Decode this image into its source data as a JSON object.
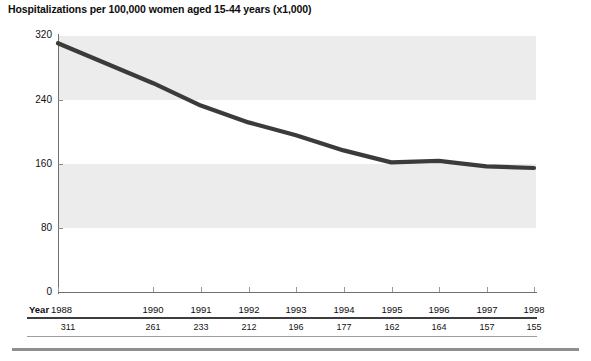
{
  "chart_data": {
    "type": "line",
    "title": "Hospitalizations per 100,000 women aged 15-44 years (x1,000)",
    "xlabel": "Year",
    "ylabel": "",
    "categories": [
      "1988",
      "1990",
      "1991",
      "1992",
      "1993",
      "1994",
      "1995",
      "1996",
      "1997",
      "1998"
    ],
    "values": [
      311,
      261,
      233,
      212,
      196,
      177,
      162,
      164,
      157,
      155
    ],
    "x_positions": [
      1988,
      1990,
      1991,
      1992,
      1993,
      1994,
      1995,
      1996,
      1997,
      1998
    ],
    "xlim": [
      1988,
      1998
    ],
    "ylim": [
      0,
      320
    ],
    "yticks": [
      0,
      80,
      160,
      240,
      320
    ],
    "ytick_labels": [
      "0",
      "80",
      "160",
      "240",
      "320"
    ],
    "grid": false,
    "banding": "alternating horizontal gray bands between 320-240 and 160-80",
    "legend": null,
    "series_color": "#3b3b3b",
    "band_color": "#ececec",
    "axis_color": "#6f6f6f"
  },
  "axis": {
    "y_labels": [
      "320",
      "240",
      "160",
      "80",
      "0"
    ],
    "x_axis_caption": "Year"
  },
  "data_table": {
    "row_label": "Year",
    "columns": [
      "1988",
      "1990",
      "1991",
      "1992",
      "1993",
      "1994",
      "1995",
      "1996",
      "1997",
      "1998"
    ],
    "values": [
      "311",
      "261",
      "233",
      "212",
      "196",
      "177",
      "162",
      "164",
      "157",
      "155"
    ]
  }
}
